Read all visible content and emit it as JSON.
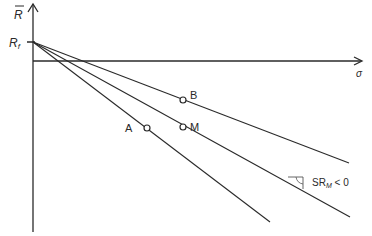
{
  "diagram": {
    "y_axis": {
      "label": "R",
      "overbar": true
    },
    "x_axis": {
      "label": "σ"
    },
    "intercept": {
      "label": "R",
      "subscript": "f"
    },
    "points": [
      {
        "id": "B",
        "label": "B"
      },
      {
        "id": "M",
        "label": "M"
      },
      {
        "id": "A",
        "label": "A"
      }
    ],
    "annotation": {
      "text_main": "SR",
      "text_sub": "M",
      "text_rest": " < 0"
    },
    "colors": {
      "line": "#2a2a2a",
      "background": "#ffffff"
    }
  }
}
